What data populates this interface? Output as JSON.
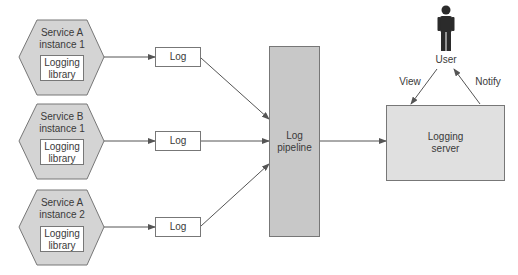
{
  "diagram": {
    "services": [
      {
        "title_line1": "Service A",
        "title_line2": "instance 1",
        "library_line1": "Logging",
        "library_line2": "library"
      },
      {
        "title_line1": "Service B",
        "title_line2": "instance 1",
        "library_line1": "Logging",
        "library_line2": "library"
      },
      {
        "title_line1": "Service A",
        "title_line2": "instance 2",
        "library_line1": "Logging",
        "library_line2": "library"
      }
    ],
    "logs": [
      {
        "label": "Log"
      },
      {
        "label": "Log"
      },
      {
        "label": "Log"
      }
    ],
    "pipeline": {
      "line1": "Log",
      "line2": "pipeline"
    },
    "server": {
      "line1": "Logging",
      "line2": "server"
    },
    "user": {
      "label": "User"
    },
    "edges": {
      "view": "View",
      "notify": "Notify"
    },
    "colors": {
      "hexagon_fill": "#d4d4d4",
      "pipeline_fill": "#c8c8c8",
      "server_fill": "#e0e0e0",
      "stroke": "#777777",
      "user_icon": "#2b2b2b"
    }
  }
}
